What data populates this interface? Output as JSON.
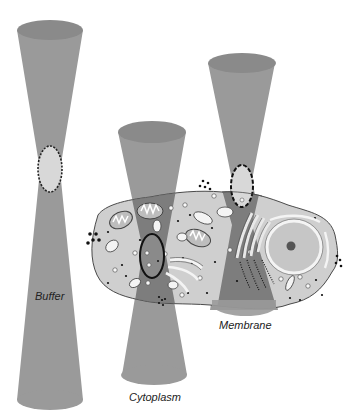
{
  "diagram": {
    "type": "illustration",
    "labels": {
      "buffer": "Buffer",
      "cytoplasm": "Cytoplasm",
      "membrane": "Membrane"
    },
    "colors": {
      "cone": "#9a9a9a",
      "cone_top": "#8a8a8a",
      "cone_inside_cell": "#6e6e6e",
      "cell_fill": "#cfcfcf",
      "cell_outline": "#4a4a4a",
      "focal_volume_fill": "#d8d8d8",
      "organelle_fill": "#bdbdbd",
      "dots": "#111111"
    }
  }
}
